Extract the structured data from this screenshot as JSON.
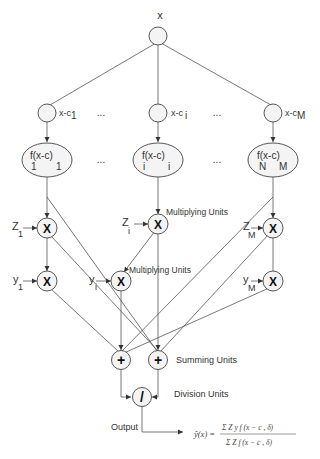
{
  "diagram": {
    "input_label": "x",
    "distance_nodes": [
      {
        "label": "x-c",
        "sub": "1"
      },
      {
        "label": "x-c",
        "sub": "i"
      },
      {
        "label": "x-c",
        "sub": "M"
      }
    ],
    "ellipsis": "...",
    "kernel_nodes": [
      {
        "f": "f",
        "fsub": "1",
        "arg": "(x-c",
        "argsub": "1",
        "close": ")"
      },
      {
        "f": "f",
        "fsub": "i",
        "arg": "(x-c",
        "argsub": "i",
        "close": ")"
      },
      {
        "f": "f",
        "fsub": "N",
        "arg": "(x-c",
        "argsub": "M",
        "close": ")"
      }
    ],
    "z_inputs": [
      {
        "label": "Z",
        "sub": "1"
      },
      {
        "label": "Z",
        "sub": "i"
      },
      {
        "label": "Z",
        "sub": "M"
      }
    ],
    "y_inputs": [
      {
        "label": "y",
        "sub": "1"
      },
      {
        "label": "y",
        "sub": "i"
      },
      {
        "label": "y",
        "sub": "M"
      }
    ],
    "multiply_symbol": "X",
    "sum_symbol": "+",
    "divide_symbol": "/",
    "annotations": {
      "multiplying_units_1": "Multiplying Units",
      "multiplying_units_2": "Multiplying Units",
      "summing_units": "Summing Units",
      "division_units": "Division Units",
      "output": "Output"
    },
    "formula": {
      "lhs": "ŷ(x) =",
      "numerator": "Σ Z y f (x − c , δ)",
      "numerator_limits": "M / i=0",
      "denominator": "Σ Z f (x − c , δ)",
      "denominator_limits": "M / i=0"
    }
  }
}
